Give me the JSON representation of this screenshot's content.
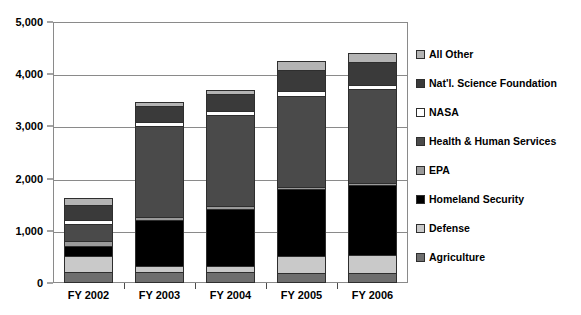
{
  "chart_data": {
    "type": "bar",
    "subtype": "stacked-bar",
    "title": "",
    "xlabel": "",
    "ylabel": "",
    "categories": [
      "FY 2002",
      "FY 2003",
      "FY 2004",
      "FY 2005",
      "FY 2006"
    ],
    "ylim": [
      0,
      5000
    ],
    "yticks": [
      0,
      1000,
      2000,
      3000,
      4000,
      5000
    ],
    "ytick_labels": [
      "0",
      "1,000",
      "2,000",
      "3,000",
      "4,000",
      "5,000"
    ],
    "grid": true,
    "legend_position": "right",
    "stack_order_bottom_to_top": [
      "Agriculture",
      "Defense",
      "Homeland Security",
      "EPA",
      "Health & Human Services",
      "NASA",
      "Nat'l. Science Foundation",
      "All Other"
    ],
    "series": [
      {
        "name": "Agriculture",
        "color": "#6e6e6e",
        "values": [
          180,
          170,
          165,
          160,
          155
        ]
      },
      {
        "name": "Defense",
        "color": "#c9c9c9",
        "values": [
          300,
          120,
          130,
          310,
          350
        ]
      },
      {
        "name": "Homeland Security",
        "color": "#000000",
        "values": [
          200,
          880,
          1090,
          1290,
          1330
        ]
      },
      {
        "name": "EPA",
        "color": "#9a9a9a",
        "values": [
          90,
          60,
          50,
          50,
          50
        ]
      },
      {
        "name": "Health & Human Services",
        "color": "#4a4a4a",
        "values": [
          320,
          1740,
          1740,
          1740,
          1790
        ]
      },
      {
        "name": "NASA",
        "color": "#ffffff",
        "values": [
          70,
          70,
          80,
          90,
          90
        ]
      },
      {
        "name": "Nat'l. Science Foundation",
        "color": "#3a3a3a",
        "values": [
          300,
          310,
          320,
          410,
          430
        ]
      },
      {
        "name": "All Other",
        "color": "#b4b4b4",
        "values": [
          140,
          80,
          90,
          160,
          170
        ]
      }
    ],
    "totals": [
      1600,
      3430,
      3665,
      4210,
      4365
    ]
  },
  "legend": {
    "items": [
      {
        "label": "All Other",
        "swatch": "legend-swatch-all-other"
      },
      {
        "label": "Nat'l. Science Foundation",
        "swatch": "legend-swatch-nsf"
      },
      {
        "label": "NASA",
        "swatch": "legend-swatch-nasa"
      },
      {
        "label": "Health & Human Services",
        "swatch": "legend-swatch-hhs"
      },
      {
        "label": "EPA",
        "swatch": "legend-swatch-epa"
      },
      {
        "label": "Homeland Security",
        "swatch": "legend-swatch-homeland"
      },
      {
        "label": "Defense",
        "swatch": "legend-swatch-defense"
      },
      {
        "label": "Agriculture",
        "swatch": "legend-swatch-agriculture"
      }
    ]
  }
}
